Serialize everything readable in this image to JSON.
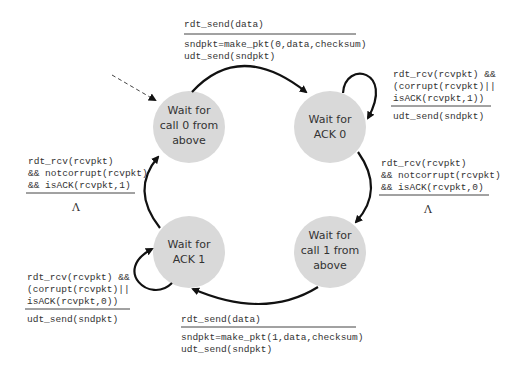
{
  "diagram": {
    "states": [
      {
        "id": "s0",
        "lines": [
          "Wait for",
          "call 0 from",
          "above"
        ],
        "initial": true
      },
      {
        "id": "s1",
        "lines": [
          "Wait for",
          "ACK 0"
        ]
      },
      {
        "id": "s2",
        "lines": [
          "Wait for",
          "call 1 from",
          "above"
        ]
      },
      {
        "id": "s3",
        "lines": [
          "Wait for",
          "ACK 1"
        ]
      }
    ],
    "transitions": [
      {
        "from": "s0",
        "to": "s1",
        "event": [
          "rdt_send(data)"
        ],
        "actions": [
          "sndpkt=make_pkt(0,data,checksum)",
          "udt_send(sndpkt)"
        ]
      },
      {
        "from": "s1",
        "to": "s1",
        "event": [
          "rdt_rcv(rcvpkt) &&",
          "(corrupt(rcvpkt)||",
          "isACK(rcvpkt,1))"
        ],
        "actions": [
          "udt_send(sndpkt)"
        ]
      },
      {
        "from": "s1",
        "to": "s2",
        "event": [
          "rdt_rcv(rcvpkt)",
          "&& notcorrupt(rcvpkt)",
          "&& isACK(rcvpkt,0)"
        ],
        "actions": [
          "Λ"
        ]
      },
      {
        "from": "s2",
        "to": "s3",
        "event": [
          "rdt_send(data)"
        ],
        "actions": [
          "sndpkt=make_pkt(1,data,checksum)",
          "udt_send(sndpkt)"
        ]
      },
      {
        "from": "s3",
        "to": "s3",
        "event": [
          "rdt_rcv(rcvpkt) &&",
          "(corrupt(rcvpkt)||",
          "isACK(rcvpkt,0))"
        ],
        "actions": [
          "udt_send(sndpkt)"
        ]
      },
      {
        "from": "s3",
        "to": "s0",
        "event": [
          "rdt_rcv(rcvpkt)",
          "&& notcorrupt(rcvpkt)",
          "&& isACK(rcvpkt,1)"
        ],
        "actions": [
          "Λ"
        ]
      }
    ]
  }
}
